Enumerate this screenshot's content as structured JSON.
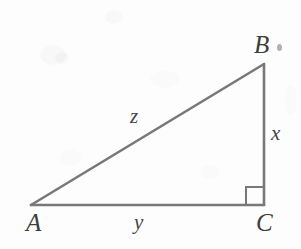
{
  "figure": {
    "kind": "geometry-diagram",
    "shape": "right-triangle",
    "background_color": "#fdfdfd",
    "stroke_color": "#787878",
    "label_color": "#3d3d3d",
    "stroke_width": 2.6,
    "width": 301,
    "height": 249
  },
  "vertices": {
    "a": {
      "label": "A",
      "x": 31,
      "y": 205,
      "label_x": 26,
      "label_y": 210
    },
    "b": {
      "label": "B",
      "x": 264,
      "y": 64,
      "label_x": 254,
      "label_y": 32
    },
    "c": {
      "label": "C",
      "x": 264,
      "y": 205,
      "label_x": 256,
      "label_y": 210
    }
  },
  "sides": {
    "hypotenuse": {
      "label": "z",
      "from": "A",
      "to": "B",
      "label_x": 130,
      "label_y": 106
    },
    "vertical": {
      "label": "x",
      "from": "B",
      "to": "C",
      "label_x": 271,
      "label_y": 123
    },
    "horizontal": {
      "label": "y",
      "from": "A",
      "to": "C",
      "label_x": 134,
      "label_y": 212
    }
  },
  "right_angle": {
    "at_vertex": "C",
    "marker": "right-angle-square",
    "size": 18,
    "x": 246,
    "y": 187
  },
  "artifacts": {
    "smudge_near_b": {
      "name": "ink-smudge",
      "x": 277,
      "y": 44
    }
  }
}
